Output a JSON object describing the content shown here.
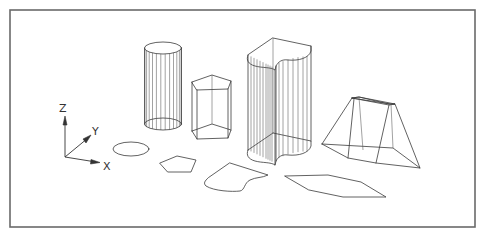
{
  "diagram": {
    "type": "3d-wireframe-illustration",
    "background": "#ffffff",
    "frame": {
      "x": 10,
      "y": 10,
      "width": 465,
      "height": 217,
      "color": "#6a6a6a"
    },
    "ucs_icon": {
      "origin": [
        65,
        157
      ],
      "axes": [
        {
          "label": "Z",
          "tip": [
            65,
            118
          ],
          "label_pos": [
            60,
            112
          ]
        },
        {
          "label": "Y",
          "tip": [
            90,
            136
          ],
          "label_pos": [
            92,
            133
          ]
        },
        {
          "label": "X",
          "tip": [
            99,
            162
          ],
          "label_pos": [
            103,
            168
          ]
        }
      ]
    },
    "solids": [
      {
        "name": "cylinder",
        "cx": 163,
        "rx": 18.5,
        "ry": 6,
        "top_y": 48,
        "bottom_y": 124,
        "generators": 14
      },
      {
        "name": "pentagonal-prism",
        "top": [
          [
            192,
            82
          ],
          [
            212,
            75
          ],
          [
            231,
            81
          ],
          [
            228,
            89
          ],
          [
            197,
            90
          ]
        ],
        "height": 49
      },
      {
        "name": "extruded-region",
        "top_y_offset": 0,
        "height": 95
      },
      {
        "name": "frustum",
        "top": [
          [
            353,
            97
          ],
          [
            358,
            97
          ],
          [
            389,
            104
          ],
          [
            397,
            103
          ]
        ],
        "bottom": [
          [
            322,
            144
          ],
          [
            348,
            158
          ],
          [
            376,
            163
          ],
          [
            420,
            168
          ],
          [
            393,
            147
          ]
        ]
      }
    ],
    "flat_shapes": [
      {
        "name": "ellipse",
        "cx": 131,
        "cy": 149,
        "rx": 18,
        "ry": 7
      },
      {
        "name": "pentagon",
        "points": [
          [
            160,
            163
          ],
          [
            177,
            156
          ],
          [
            196,
            160
          ],
          [
            191,
            172
          ],
          [
            168,
            172
          ]
        ]
      },
      {
        "name": "region-outline"
      },
      {
        "name": "hexagon-polygon",
        "points": [
          [
            285,
            176
          ],
          [
            328,
            175
          ],
          [
            361,
            182
          ],
          [
            386,
            197
          ],
          [
            343,
            197
          ],
          [
            309,
            190
          ]
        ]
      }
    ],
    "labels": {
      "z": "Z",
      "y": "Y",
      "x": "X"
    }
  }
}
